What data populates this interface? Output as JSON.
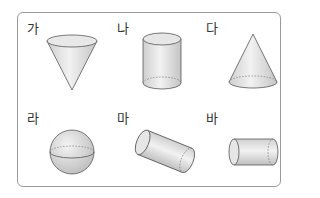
{
  "figure": {
    "items": [
      {
        "label": "가",
        "shape": "inverted-cone"
      },
      {
        "label": "나",
        "shape": "cylinder"
      },
      {
        "label": "다",
        "shape": "cone"
      },
      {
        "label": "라",
        "shape": "sphere"
      },
      {
        "label": "마",
        "shape": "tilted-cylinder"
      },
      {
        "label": "바",
        "shape": "horizontal-cylinder"
      }
    ],
    "colors": {
      "stroke": "#555555",
      "fill_light": "#eeeeee",
      "fill_dark": "#c8c8c8",
      "border": "#9a9a9a"
    }
  }
}
